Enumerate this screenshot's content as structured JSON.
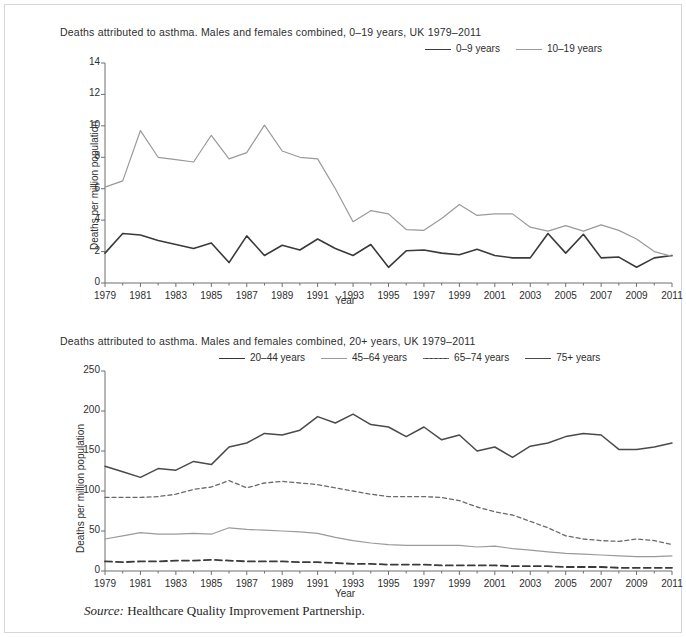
{
  "figure": {
    "source_prefix": "Source:",
    "source_text": "Healthcare Quality Improvement Partnership.",
    "border_color": "#d6d6d6",
    "background": "#ffffff"
  },
  "chart_data": [
    {
      "id": "asthma-deaths-0-19",
      "type": "line",
      "title": "Deaths attributed to asthma. Males and females combined, 0–19 years, UK 1979–2011",
      "xlabel": "Year",
      "ylabel": "Deaths per million population",
      "ylim": [
        0,
        14
      ],
      "yticks": [
        0,
        2,
        4,
        6,
        8,
        10,
        12,
        14
      ],
      "ytick_labels": [
        "0",
        "2",
        "4",
        "6",
        "8",
        "10",
        "12",
        "14"
      ],
      "xlim": [
        1979,
        2011
      ],
      "xticks": [
        1979,
        1981,
        1983,
        1985,
        1987,
        1989,
        1991,
        1993,
        1995,
        1997,
        1999,
        2001,
        2003,
        2005,
        2007,
        2009,
        2011
      ],
      "xtick_labels": [
        "1979",
        "1981",
        "1983",
        "1985",
        "1987",
        "1989",
        "1991",
        "1993",
        "1995",
        "1997",
        "1999",
        "2001",
        "2003",
        "2005",
        "2007",
        "2009",
        "2011"
      ],
      "minor_xticks": true,
      "grid": false,
      "legend_position": "top-right",
      "x": [
        1979,
        1980,
        1981,
        1982,
        1983,
        1984,
        1985,
        1986,
        1987,
        1988,
        1989,
        1990,
        1991,
        1992,
        1993,
        1994,
        1995,
        1996,
        1997,
        1998,
        1999,
        2000,
        2001,
        2002,
        2003,
        2004,
        2005,
        2006,
        2007,
        2008,
        2009,
        2010,
        2011
      ],
      "series": [
        {
          "name": "0–9 years",
          "color": "#3a3a3a",
          "style": "solid",
          "width": 1.6,
          "values": [
            1.9,
            3.15,
            3.05,
            2.7,
            2.45,
            2.2,
            2.55,
            1.3,
            3.0,
            1.75,
            2.4,
            2.1,
            2.8,
            2.2,
            1.75,
            2.45,
            1.0,
            2.05,
            2.1,
            1.9,
            1.8,
            2.15,
            1.75,
            1.6,
            1.6,
            3.15,
            1.9,
            3.1,
            1.6,
            1.65,
            1.0,
            1.6,
            1.75
          ]
        },
        {
          "name": "10–19 years",
          "color": "#9a9a9a",
          "style": "solid",
          "width": 1.2,
          "values": [
            6.1,
            6.5,
            9.7,
            8.0,
            7.85,
            7.7,
            9.4,
            7.9,
            8.3,
            10.05,
            8.4,
            8.0,
            7.9,
            6.0,
            3.9,
            4.6,
            4.4,
            3.4,
            3.35,
            4.1,
            5.0,
            4.3,
            4.4,
            4.4,
            3.55,
            3.3,
            3.65,
            3.3,
            3.7,
            3.35,
            2.8,
            2.0,
            1.7
          ]
        }
      ]
    },
    {
      "id": "asthma-deaths-20-plus",
      "type": "line",
      "title": "Deaths attributed to asthma. Males and females combined, 20+ years, UK 1979–2011",
      "xlabel": "Year",
      "ylabel": "Deaths per million population",
      "ylim": [
        0,
        250
      ],
      "yticks": [
        0,
        50,
        100,
        150,
        200,
        250
      ],
      "ytick_labels": [
        "0",
        "50",
        "100",
        "150",
        "200",
        "250"
      ],
      "xlim": [
        1979,
        2011
      ],
      "xticks": [
        1979,
        1981,
        1983,
        1985,
        1987,
        1989,
        1991,
        1993,
        1995,
        1997,
        1999,
        2001,
        2003,
        2005,
        2007,
        2009,
        2011
      ],
      "xtick_labels": [
        "1979",
        "1981",
        "1983",
        "1985",
        "1987",
        "1989",
        "1991",
        "1993",
        "1995",
        "1997",
        "1999",
        "2001",
        "2003",
        "2005",
        "2007",
        "2009",
        "2011"
      ],
      "minor_xticks": true,
      "grid": false,
      "legend_position": "top-right",
      "x": [
        1979,
        1980,
        1981,
        1982,
        1983,
        1984,
        1985,
        1986,
        1987,
        1988,
        1989,
        1990,
        1991,
        1992,
        1993,
        1994,
        1995,
        1996,
        1997,
        1998,
        1999,
        2000,
        2001,
        2002,
        2003,
        2004,
        2005,
        2006,
        2007,
        2008,
        2009,
        2010,
        2011
      ],
      "series": [
        {
          "name": "20–44 years",
          "color": "#3a3a3a",
          "style": "dashed",
          "width": 1.8,
          "dash": "7,4",
          "values": [
            12,
            11,
            12,
            12,
            13,
            13,
            14,
            13,
            12,
            12,
            12,
            11,
            11,
            10,
            9,
            9,
            8,
            8,
            8,
            7,
            7,
            7,
            7,
            6,
            6,
            6,
            5,
            5,
            5,
            4,
            4,
            4,
            4
          ]
        },
        {
          "name": "45–64 years",
          "color": "#9a9a9a",
          "style": "solid",
          "width": 1.2,
          "values": [
            40,
            44,
            48,
            46,
            46,
            47,
            46,
            54,
            52,
            51,
            50,
            49,
            47,
            42,
            38,
            35,
            33,
            32,
            32,
            32,
            32,
            30,
            31,
            28,
            26,
            24,
            22,
            21,
            20,
            19,
            18,
            18,
            19
          ]
        },
        {
          "name": "65–74 years",
          "color": "#6a6a6a",
          "style": "fine-dashed",
          "width": 1.3,
          "dash": "4,3",
          "values": [
            92,
            92,
            92,
            93,
            96,
            102,
            105,
            113,
            104,
            110,
            112,
            110,
            108,
            104,
            100,
            96,
            93,
            93,
            93,
            92,
            88,
            80,
            74,
            70,
            62,
            54,
            44,
            40,
            38,
            37,
            40,
            38,
            33
          ]
        },
        {
          "name": "75+ years",
          "color": "#4a4a4a",
          "style": "solid",
          "width": 1.5,
          "values": [
            131,
            124,
            117,
            128,
            126,
            137,
            133,
            155,
            160,
            172,
            170,
            176,
            193,
            185,
            196,
            183,
            180,
            168,
            180,
            164,
            170,
            150,
            155,
            142,
            156,
            160,
            168,
            172,
            170,
            152,
            152,
            155,
            160
          ]
        }
      ]
    }
  ]
}
